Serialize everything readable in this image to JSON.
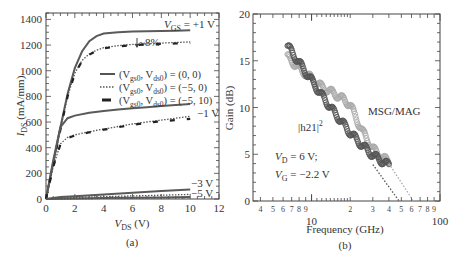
{
  "chart_data": [
    {
      "panel": "(a)",
      "type": "line",
      "title": "",
      "xlabel": "V_DS (V)",
      "ylabel": "I_DS (mA/mm)",
      "xlim": [
        0,
        12
      ],
      "ylim": [
        0,
        1450
      ],
      "xticks": [
        0,
        2,
        4,
        6,
        8,
        10,
        12
      ],
      "yticks": [
        0,
        200,
        400,
        600,
        800,
        1000,
        1200,
        1400
      ],
      "legend": [
        {
          "label": "(V_gs0, V_ds0) = (0, 0)",
          "style": "solid"
        },
        {
          "label": "(V_gs0, V_ds0) = (−5, 0)",
          "style": "dotted"
        },
        {
          "label": "(V_gs0, V_ds0) = (−5, 10)",
          "style": "dashed"
        }
      ],
      "annotations": [
        "V_GS = +1 V",
        "~8%",
        "−1 V",
        "−3 V",
        "−5 V"
      ],
      "series": [
        {
          "name": "VGS=+1V (0,0)",
          "style": "solid",
          "x": [
            0,
            0.5,
            1,
            1.5,
            2,
            2.5,
            3,
            3.5,
            4,
            5,
            6,
            7,
            8,
            9,
            10
          ],
          "y": [
            0,
            280,
            560,
            820,
            1020,
            1150,
            1230,
            1270,
            1290,
            1300,
            1305,
            1308,
            1310,
            1312,
            1315
          ]
        },
        {
          "name": "VGS=+1V (-5,0)",
          "style": "dotted",
          "x": [
            0,
            0.5,
            1,
            1.5,
            2,
            2.5,
            3,
            3.5,
            4,
            5,
            6,
            7,
            8,
            9,
            10
          ],
          "y": [
            0,
            270,
            540,
            800,
            980,
            1080,
            1130,
            1160,
            1180,
            1195,
            1205,
            1210,
            1215,
            1220,
            1225
          ]
        },
        {
          "name": "VGS=+1V (-5,10)",
          "style": "dashed",
          "x": [
            0,
            0.5,
            1,
            1.5,
            2,
            2.5,
            3,
            3.5,
            4,
            5,
            6,
            7,
            8,
            9,
            10
          ],
          "y": [
            0,
            270,
            540,
            800,
            975,
            1075,
            1125,
            1155,
            1175,
            1190,
            1200,
            1205,
            1210,
            1212,
            1215
          ]
        },
        {
          "name": "VGS=-1V (0,0)",
          "style": "solid",
          "x": [
            0,
            0.5,
            1,
            1.5,
            2,
            3,
            4,
            5,
            6,
            7,
            8,
            9,
            10
          ],
          "y": [
            0,
            300,
            560,
            630,
            650,
            672,
            685,
            697,
            707,
            716,
            724,
            732,
            740
          ]
        },
        {
          "name": "VGS=-1V (-5,0)",
          "style": "dotted",
          "x": [
            0,
            0.5,
            1,
            1.5,
            2,
            3,
            4,
            5,
            6,
            7,
            8,
            9,
            10
          ],
          "y": [
            0,
            250,
            430,
            480,
            500,
            525,
            545,
            565,
            585,
            600,
            615,
            630,
            645
          ]
        },
        {
          "name": "VGS=-1V (-5,10)",
          "style": "dashed",
          "x": [
            0,
            0.5,
            1,
            1.5,
            2,
            3,
            4,
            5,
            6,
            7,
            8,
            9,
            10
          ],
          "y": [
            0,
            250,
            425,
            475,
            495,
            520,
            540,
            560,
            578,
            595,
            605,
            615,
            625
          ]
        },
        {
          "name": "VGS=-3V (0,0)",
          "style": "solid",
          "x": [
            0,
            1,
            2,
            4,
            6,
            8,
            10
          ],
          "y": [
            0,
            15,
            22,
            35,
            48,
            62,
            75
          ]
        },
        {
          "name": "VGS=-3V (-5,0)",
          "style": "dotted",
          "x": [
            0,
            1,
            2,
            4,
            6,
            8,
            10
          ],
          "y": [
            0,
            8,
            12,
            18,
            24,
            30,
            36
          ]
        },
        {
          "name": "VGS=-5V (0,0)",
          "style": "solid",
          "x": [
            0,
            2,
            4,
            6,
            8,
            10
          ],
          "y": [
            0,
            5,
            8,
            10,
            12,
            15
          ]
        },
        {
          "name": "VGS=-5V (-5,0)",
          "style": "dotted",
          "x": [
            0,
            2,
            4,
            6,
            8,
            10
          ],
          "y": [
            0,
            3,
            5,
            7,
            9,
            12
          ]
        }
      ]
    },
    {
      "panel": "(b)",
      "type": "scatter",
      "title": "",
      "xlabel": "Frequency (GHz)",
      "ylabel": "Gain (dB)",
      "xscale": "log",
      "xlim": [
        3.5,
        100
      ],
      "ylim": [
        0,
        20
      ],
      "xticks_major": [
        10,
        100
      ],
      "xticks_minor_labels": [
        "4",
        "5",
        "6",
        "7",
        "8",
        "9",
        "2",
        "3",
        "4",
        "5",
        "6",
        "7",
        "8",
        "9"
      ],
      "yticks": [
        0,
        5,
        10,
        15,
        20
      ],
      "annotations": [
        "MSG/MAG",
        "|h21|²",
        "V_D = 6 V;",
        "V_G = −2.2 V"
      ],
      "series": [
        {
          "name": "|h21|^2",
          "marker": "circle",
          "color": "#555555",
          "x": [
            6.5,
            8,
            10,
            12,
            15,
            20,
            25,
            30,
            35,
            40
          ],
          "y": [
            16.6,
            14.8,
            12.9,
            11.3,
            9.5,
            7.3,
            5.9,
            4.9,
            4.3,
            3.8
          ]
        },
        {
          "name": "MSG/MAG",
          "marker": "circle",
          "color": "#aaaaaa",
          "x": [
            6.5,
            8,
            10,
            12,
            15,
            18,
            20,
            22,
            25,
            30,
            35,
            40
          ],
          "y": [
            15.4,
            14.2,
            13.1,
            12.2,
            11.5,
            10.8,
            10.3,
            9.0,
            7.4,
            5.6,
            4.7,
            4.2
          ]
        },
        {
          "name": "|h21|^2 extrapolation",
          "style": "dotted",
          "color": "#555555",
          "x": [
            30,
            48
          ],
          "y": [
            3.9,
            0
          ]
        },
        {
          "name": "MSG/MAG extrapolation",
          "style": "dotted",
          "color": "#aaaaaa",
          "x": [
            40,
            62
          ],
          "y": [
            4.0,
            0
          ]
        }
      ]
    }
  ],
  "labels": {
    "panel_a": "(a)",
    "panel_b": "(b)",
    "a_xlabel_main": "V",
    "a_xlabel_sub": "DS",
    "a_xlabel_unit": " (V)",
    "a_ylabel_main": "I",
    "a_ylabel_sub": "DS",
    "a_ylabel_unit": " (mA/mm)",
    "a_vgs_main": "V",
    "a_vgs_sub": "GS",
    "a_vgs_val": " = +1 V",
    "a_pct": "~8%",
    "a_m1": "−1 V",
    "a_m3": "−3 V",
    "a_m5": "−5 V",
    "legend": [
      {
        "pre": "(V",
        "s1": "gs0",
        "mid": ", V",
        "s2": "ds0",
        "post": ") = (0, 0)"
      },
      {
        "pre": "(V",
        "s1": "gs0",
        "mid": ", V",
        "s2": "ds0",
        "post": ") = (−5, 0)"
      },
      {
        "pre": "(V",
        "s1": "gs0",
        "mid": ", V",
        "s2": "ds0",
        "post": ") = (−5, 10)"
      }
    ],
    "a_xticks": [
      "0",
      "2",
      "4",
      "6",
      "8",
      "10",
      "12"
    ],
    "a_yticks": [
      "0",
      "200",
      "400",
      "600",
      "800",
      "1000",
      "1200",
      "1400"
    ],
    "b_ylabel": "Gain (dB)",
    "b_xlabel": "Frequency (GHz)",
    "b_yticks": [
      "0",
      "5",
      "10",
      "15",
      "20"
    ],
    "b_major": [
      "10",
      "100"
    ],
    "b_minor": [
      "4",
      "5",
      "6",
      "7",
      "8",
      "9",
      "2",
      "3",
      "4",
      "5",
      "6",
      "7",
      "8",
      "9"
    ],
    "b_msg": "MSG/MAG",
    "b_h21": "|h21|",
    "b_h21_sup": "2",
    "b_vd_main": "V",
    "b_vd_sub": "D",
    "b_vd_val": " = 6 V;",
    "b_vg_main": "V",
    "b_vg_sub": "G",
    "b_vg_val": " = −2.2 V"
  },
  "colors": {
    "axis": "#333333",
    "dark_series": "#555555",
    "light_series": "#aaaaaa"
  }
}
